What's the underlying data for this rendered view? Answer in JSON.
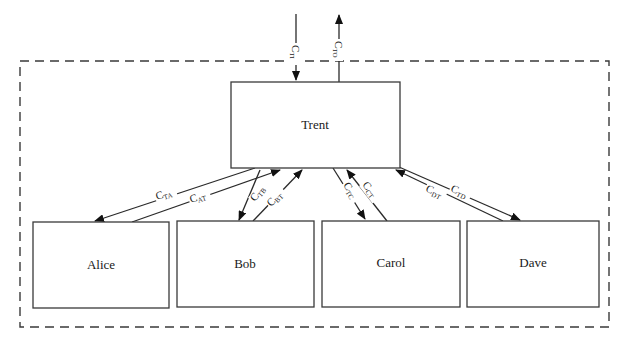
{
  "diagram": {
    "boundary": {
      "style": "dashed",
      "x": 20,
      "y": 61,
      "width": 589,
      "height": 266
    },
    "nodes": {
      "trent": {
        "label": "Trent",
        "x": 231,
        "y": 82,
        "width": 169,
        "height": 86
      },
      "alice": {
        "label": "Alice",
        "x": 33,
        "y": 222,
        "width": 136,
        "height": 86
      },
      "bob": {
        "label": "Bob",
        "x": 177,
        "y": 221,
        "width": 137,
        "height": 86
      },
      "carol": {
        "label": "Carol",
        "x": 322,
        "y": 221,
        "width": 138,
        "height": 86
      },
      "dave": {
        "label": "Dave",
        "x": 467,
        "y": 221,
        "width": 132,
        "height": 86
      }
    },
    "edges": {
      "c_ti": {
        "main": "C",
        "sub": "TI",
        "from": "external",
        "to": "Trent"
      },
      "c_to": {
        "main": "C",
        "sub": "TO",
        "from": "Trent",
        "to": "external"
      },
      "c_ta": {
        "main": "C",
        "sub": "TA",
        "from": "Trent",
        "to": "Alice"
      },
      "c_at": {
        "main": "C",
        "sub": "AT",
        "from": "Alice",
        "to": "Trent"
      },
      "c_tb": {
        "main": "C",
        "sub": "TB",
        "from": "Trent",
        "to": "Bob"
      },
      "c_bt": {
        "main": "C",
        "sub": "BT",
        "from": "Bob",
        "to": "Trent"
      },
      "c_tc": {
        "main": "C",
        "sub": "TC",
        "from": "Trent",
        "to": "Carol"
      },
      "c_ct": {
        "main": "C",
        "sub": "CT",
        "from": "Carol",
        "to": "Trent"
      },
      "c_dt": {
        "main": "C",
        "sub": "DT",
        "from": "Dave",
        "to": "Trent"
      },
      "c_td": {
        "main": "C",
        "sub": "TD",
        "from": "Trent",
        "to": "Dave"
      }
    }
  }
}
